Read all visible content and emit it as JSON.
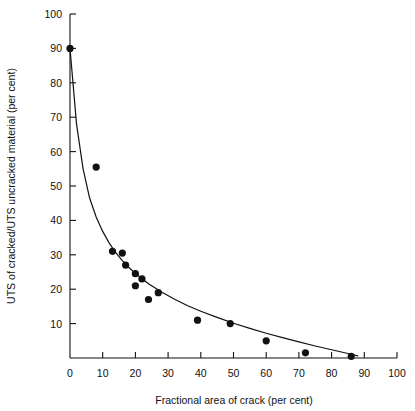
{
  "chart_data": {
    "type": "scatter",
    "title": "",
    "subtitle": "",
    "xlabel": "Fractional area of crack (per cent)",
    "ylabel": "UTS of cracked/UTS uncracked material (per cent)",
    "xlim": [
      0,
      100
    ],
    "ylim": [
      0,
      100
    ],
    "xticks": [
      0,
      10,
      20,
      30,
      40,
      50,
      60,
      70,
      80,
      90,
      100
    ],
    "yticks": [
      10,
      20,
      30,
      40,
      50,
      60,
      70,
      80,
      90,
      100
    ],
    "xtick_labels": [
      "0",
      "10",
      "20",
      "30",
      "40",
      "50",
      "60",
      "70",
      "80",
      "90",
      "100"
    ],
    "ytick_labels": [
      "10",
      "20",
      "30",
      "40",
      "50",
      "60",
      "70",
      "80",
      "90",
      "100"
    ],
    "grid": false,
    "legend": null,
    "legend_position": "none",
    "marker": "filled-circle",
    "marker_color": "#111111",
    "marker_size": 5,
    "line_color": "#111111",
    "points": [
      {
        "x": 0,
        "y": 90.0
      },
      {
        "x": 8,
        "y": 55.5
      },
      {
        "x": 13,
        "y": 31.0
      },
      {
        "x": 16,
        "y": 30.5
      },
      {
        "x": 17,
        "y": 27.0
      },
      {
        "x": 20,
        "y": 24.5
      },
      {
        "x": 20,
        "y": 21.0
      },
      {
        "x": 22,
        "y": 23.0
      },
      {
        "x": 24,
        "y": 17.0
      },
      {
        "x": 27,
        "y": 19.0
      },
      {
        "x": 39,
        "y": 11.0
      },
      {
        "x": 49,
        "y": 10.0
      },
      {
        "x": 60,
        "y": 5.0
      },
      {
        "x": 72,
        "y": 1.5
      },
      {
        "x": 86,
        "y": 0.5
      }
    ],
    "fit_curve": [
      {
        "x": 0,
        "y": 90.0
      },
      {
        "x": 2,
        "y": 68.0
      },
      {
        "x": 4,
        "y": 55.0
      },
      {
        "x": 6,
        "y": 46.5
      },
      {
        "x": 8,
        "y": 41.0
      },
      {
        "x": 10,
        "y": 36.8
      },
      {
        "x": 12,
        "y": 33.4
      },
      {
        "x": 14,
        "y": 30.6
      },
      {
        "x": 16,
        "y": 28.3
      },
      {
        "x": 18,
        "y": 26.3
      },
      {
        "x": 20,
        "y": 24.6
      },
      {
        "x": 24,
        "y": 21.6
      },
      {
        "x": 28,
        "y": 19.2
      },
      {
        "x": 32,
        "y": 17.1
      },
      {
        "x": 36,
        "y": 15.2
      },
      {
        "x": 40,
        "y": 13.6
      },
      {
        "x": 45,
        "y": 11.8
      },
      {
        "x": 50,
        "y": 10.1
      },
      {
        "x": 55,
        "y": 8.6
      },
      {
        "x": 60,
        "y": 7.2
      },
      {
        "x": 65,
        "y": 5.9
      },
      {
        "x": 70,
        "y": 4.7
      },
      {
        "x": 75,
        "y": 3.5
      },
      {
        "x": 80,
        "y": 2.4
      },
      {
        "x": 85,
        "y": 1.3
      },
      {
        "x": 88,
        "y": 0.6
      }
    ]
  }
}
